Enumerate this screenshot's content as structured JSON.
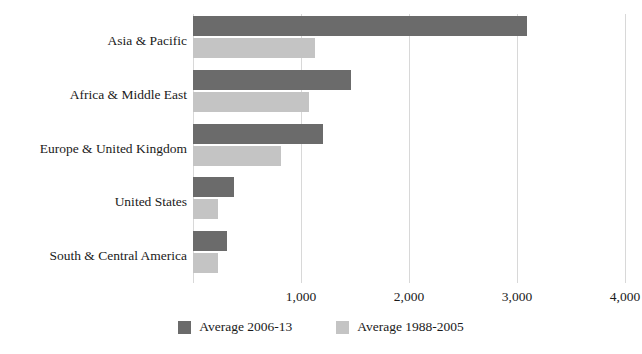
{
  "chart_data": {
    "type": "bar",
    "orientation": "horizontal",
    "title": "",
    "subtitle": "",
    "xlabel": "",
    "ylabel": "",
    "categories": [
      "Asia & Pacific",
      "Africa & Middle East",
      "Europe & United Kingdom",
      "United States",
      "South & Central America"
    ],
    "series": [
      {
        "name": "Average 2006-13",
        "color": "#6b6b6b",
        "values": [
          3096,
          1462,
          1202,
          375,
          317
        ]
      },
      {
        "name": "Average 1988-2005",
        "color": "#c4c4c4",
        "values": [
          1125,
          1077,
          817,
          231,
          231
        ]
      }
    ],
    "xlim": [
      0,
      4000
    ],
    "xticks": [
      0,
      1000,
      2000,
      3000,
      4000
    ],
    "xtick_labels": [
      "",
      "1,000",
      "2,000",
      "3,000",
      "4,000"
    ],
    "grid": true,
    "grid_axis": "x",
    "legend_position": "bottom"
  },
  "legend": {
    "entries": [
      {
        "label": "Average 2006-13",
        "color": "#6b6b6b"
      },
      {
        "label": "Average 1988-2005",
        "color": "#c4c4c4"
      }
    ]
  },
  "colors": {
    "series_recent": "#6b6b6b",
    "series_older": "#c4c4c4",
    "gridline": "#d8d8d8",
    "text": "#1a1a1a",
    "background": "#ffffff"
  }
}
